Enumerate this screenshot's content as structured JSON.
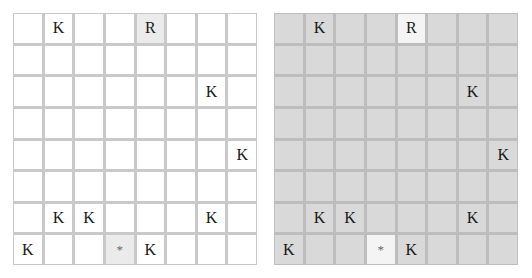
{
  "boards": [
    {
      "id": "left",
      "theme": "light",
      "colors": {
        "cell": "#ffffff",
        "highlight": "#ebebeb",
        "grid": "#c9c9c9"
      },
      "rows": [
        [
          "",
          "K",
          "",
          "",
          "R",
          "",
          "",
          ""
        ],
        [
          "",
          "",
          "",
          "",
          "",
          "",
          "",
          ""
        ],
        [
          "",
          "",
          "",
          "",
          "",
          "",
          "K",
          ""
        ],
        [
          "",
          "",
          "",
          "",
          "",
          "",
          "",
          ""
        ],
        [
          "",
          "",
          "",
          "",
          "",
          "",
          "",
          "K"
        ],
        [
          "",
          "",
          "",
          "",
          "",
          "",
          "",
          ""
        ],
        [
          "",
          "K",
          "K",
          "",
          "",
          "",
          "K",
          ""
        ],
        [
          "K",
          "",
          "",
          "*",
          "K",
          "",
          "",
          ""
        ]
      ],
      "highlighted": [
        [
          0,
          4
        ],
        [
          7,
          3
        ]
      ]
    },
    {
      "id": "right",
      "theme": "shaded",
      "colors": {
        "cell": "#d9d9d9",
        "highlight": "#f4f4f4",
        "grid": "#bdbdbd"
      },
      "rows": [
        [
          "",
          "K",
          "",
          "",
          "R",
          "",
          "",
          ""
        ],
        [
          "",
          "",
          "",
          "",
          "",
          "",
          "",
          ""
        ],
        [
          "",
          "",
          "",
          "",
          "",
          "",
          "K",
          ""
        ],
        [
          "",
          "",
          "",
          "",
          "",
          "",
          "",
          ""
        ],
        [
          "",
          "",
          "",
          "",
          "",
          "",
          "",
          "K"
        ],
        [
          "",
          "",
          "",
          "",
          "",
          "",
          "",
          ""
        ],
        [
          "",
          "K",
          "K",
          "",
          "",
          "",
          "K",
          ""
        ],
        [
          "K",
          "",
          "",
          "*",
          "K",
          "",
          "",
          ""
        ]
      ],
      "highlighted": [
        [
          0,
          4
        ],
        [
          7,
          3
        ]
      ]
    }
  ]
}
